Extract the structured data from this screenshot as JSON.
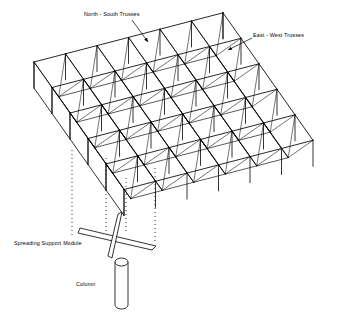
{
  "figure": {
    "background_color": "#ffffff",
    "line_color": "#000000",
    "width": 349,
    "height": 313
  },
  "labels": {
    "north_south_trusses": "North - South Trusses",
    "east_west_trusses": "East - West Trusses",
    "spreading_support_module": "Spreading Support Module",
    "column": "Column"
  },
  "leaders": [
    {
      "name": "leader-north-south",
      "from": [
        132,
        20
      ],
      "to": [
        148,
        42
      ],
      "arrow_at": "to"
    },
    {
      "name": "leader-east-west",
      "from": [
        252,
        38
      ],
      "to": [
        228,
        50
      ],
      "arrow_at": "to"
    }
  ],
  "geometry": {
    "projection": "axonometric",
    "grid_cols": 6,
    "grid_rows": 5,
    "origin": [
      34,
      62
    ],
    "u_step": [
      31.5,
      -8.2
    ],
    "v_step": [
      18.0,
      25.5
    ],
    "truss_depth": 26,
    "chord_top": "continuous diagonal lines both directions",
    "web_pattern": "pyramid diagonals from top nodes to bottom nodes"
  },
  "support": {
    "plumb_lines": [
      {
        "x": 72,
        "y_top": 150,
        "y_bottom": 236
      },
      {
        "x": 106,
        "y_top": 158,
        "y_bottom": 240
      },
      {
        "x": 126,
        "y_top": 178,
        "y_bottom": 232
      },
      {
        "x": 155,
        "y_top": 168,
        "y_bottom": 244
      }
    ],
    "module": {
      "name": "spreading-support-module",
      "center": [
        116,
        238
      ],
      "plate_a": [
        [
          80,
          228
        ],
        [
          156,
          246
        ],
        [
          152,
          250
        ],
        [
          78,
          233
        ]
      ],
      "plate_b": [
        [
          122,
          212
        ],
        [
          112,
          258
        ],
        [
          108,
          256
        ],
        [
          118,
          214
        ]
      ]
    },
    "column": {
      "name": "column",
      "x": 115,
      "y_top": 262,
      "y_bottom": 305,
      "width": 13,
      "cap_height": 4
    }
  },
  "chart_data": {
    "type": "diagram",
    "components": [
      "North - South Trusses",
      "East - West Trusses",
      "Spreading Support Module",
      "Column"
    ]
  }
}
